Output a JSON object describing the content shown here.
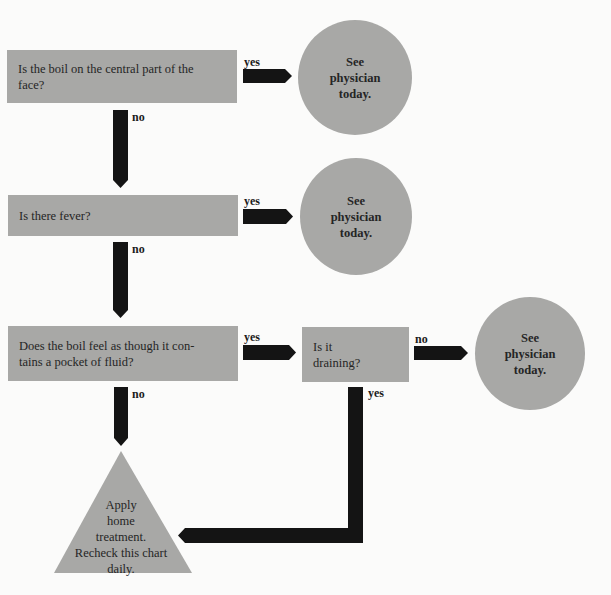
{
  "colors": {
    "node_fill": "#a8a8a6",
    "arrow": "#141414",
    "background": "#fbfbfa",
    "text": "#252525"
  },
  "questions": [
    {
      "id": "q1",
      "text": "Is the boil on the central part of the face?"
    },
    {
      "id": "q2",
      "text": "Is there fever?"
    },
    {
      "id": "q3",
      "text": "Does the boil feel as though it con-tains a pocket of fluid?",
      "line1": "Does the boil feel as though it con-",
      "line2": "tains a pocket of fluid?"
    },
    {
      "id": "q4",
      "text": "Is it draining?",
      "line1": "Is it",
      "line2": "draining?"
    }
  ],
  "outcomes": [
    {
      "id": "o1",
      "shape": "circle",
      "text": "See physician today."
    },
    {
      "id": "o2",
      "shape": "circle",
      "text": "See physician today."
    },
    {
      "id": "o3",
      "shape": "circle",
      "text": "See physician today."
    },
    {
      "id": "o4",
      "shape": "triangle",
      "line1": "Apply",
      "line2": "home",
      "line3": "treatment.",
      "line4": "Recheck this chart",
      "line5": "daily."
    }
  ],
  "edges": [
    {
      "from": "q1",
      "to": "o1",
      "label": "yes"
    },
    {
      "from": "q1",
      "to": "q2",
      "label": "no"
    },
    {
      "from": "q2",
      "to": "o2",
      "label": "yes"
    },
    {
      "from": "q2",
      "to": "q3",
      "label": "no"
    },
    {
      "from": "q3",
      "to": "q4",
      "label": "yes"
    },
    {
      "from": "q3",
      "to": "o4",
      "label": "no"
    },
    {
      "from": "q4",
      "to": "o3",
      "label": "no"
    },
    {
      "from": "q4",
      "to": "o4",
      "label": "yes"
    }
  ]
}
